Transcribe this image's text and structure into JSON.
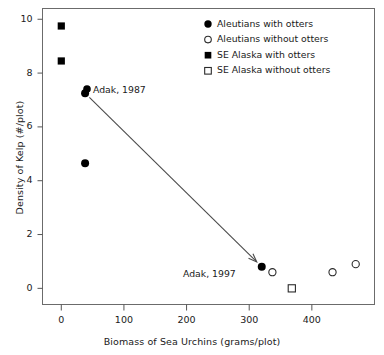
{
  "chart_data": {
    "type": "scatter",
    "title": "",
    "xlabel": "Biomass of Sea Urchins (grams/plot)",
    "ylabel": "Density of Kelp (#/plot)",
    "xlim": [
      -30,
      500
    ],
    "ylim": [
      -0.6,
      10.4
    ],
    "xticks": [
      0,
      100,
      200,
      300,
      400
    ],
    "yticks": [
      0,
      2,
      4,
      6,
      8,
      10
    ],
    "xtick_labels": [
      "0",
      "100",
      "200",
      "300",
      "400"
    ],
    "ytick_labels": [
      "0",
      "2",
      "4",
      "6",
      "8",
      "10"
    ],
    "grid": false,
    "legend_position": "top-right",
    "series": [
      {
        "name": "Aleutians with otters",
        "marker": "filled-circle",
        "color": "#000000",
        "points": [
          {
            "x": 38,
            "y": 7.25
          },
          {
            "x": 38,
            "y": 4.65
          },
          {
            "x": 320,
            "y": 0.8
          }
        ]
      },
      {
        "name": "Aleutians without otters",
        "marker": "open-circle",
        "color": "#000000",
        "points": [
          {
            "x": 337,
            "y": 0.6
          },
          {
            "x": 433,
            "y": 0.6
          },
          {
            "x": 470,
            "y": 0.9
          }
        ]
      },
      {
        "name": "SE Alaska with otters",
        "marker": "filled-square",
        "color": "#000000",
        "points": [
          {
            "x": 0,
            "y": 9.75
          },
          {
            "x": 0,
            "y": 8.45
          }
        ]
      },
      {
        "name": "SE Alaska without otters",
        "marker": "open-square",
        "color": "#000000",
        "points": [
          {
            "x": 368,
            "y": 0.0
          }
        ]
      }
    ],
    "annotations": [
      {
        "text": "Adak, 1987",
        "x": 38,
        "y": 7.25
      },
      {
        "text": "Adak, 1997",
        "x": 320,
        "y": 0.8
      }
    ],
    "arrows": [
      {
        "from": {
          "x": 38,
          "y": 7.25
        },
        "to": {
          "x": 320,
          "y": 0.8
        }
      }
    ]
  },
  "legend": {
    "entries": [
      {
        "label": "Aleutians with otters",
        "marker": "filled-circle"
      },
      {
        "label": "Aleutians without otters",
        "marker": "open-circle"
      },
      {
        "label": "SE Alaska with otters",
        "marker": "filled-square"
      },
      {
        "label": "SE Alaska without otters",
        "marker": "open-square"
      }
    ]
  },
  "axes": {
    "xlabel": "Biomass of Sea Urchins (grams/plot)",
    "ylabel": "Density of Kelp (#/plot)",
    "xtick_labels": [
      "0",
      "100",
      "200",
      "300",
      "400"
    ],
    "ytick_labels": [
      "0",
      "2",
      "4",
      "6",
      "8",
      "10"
    ]
  },
  "annotations": {
    "adak_1987": "Adak, 1987",
    "adak_1997": "Adak, 1997"
  },
  "colors": {
    "axis": "#555555",
    "frame": "#6b6b6b",
    "marker": "#000000",
    "arrow": "#4a4a4a",
    "text": "#1a1a1a"
  }
}
